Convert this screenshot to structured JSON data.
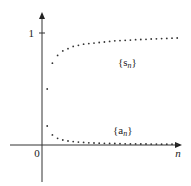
{
  "chart_data": {
    "type": "scatter",
    "title": "",
    "xlabel": "n",
    "ylabel": "",
    "origin_label": "0",
    "yticks": [
      {
        "value": 1,
        "label": "1"
      }
    ],
    "xlim": [
      0,
      28
    ],
    "ylim": [
      -0.3,
      1.2
    ],
    "grid": false,
    "legend": "inline labels",
    "series": [
      {
        "name": "{s_n}",
        "label_main": "{s",
        "label_sub": "n",
        "label_close": "}",
        "x": [
          1,
          2,
          3,
          4,
          5,
          6,
          7,
          8,
          9,
          10,
          11,
          12,
          13,
          14,
          15,
          16,
          17,
          18,
          19,
          20,
          21,
          22,
          23,
          24,
          25,
          26
        ],
        "values": [
          0.5,
          0.73,
          0.8,
          0.84,
          0.86,
          0.88,
          0.89,
          0.9,
          0.905,
          0.91,
          0.915,
          0.92,
          0.925,
          0.93,
          0.932,
          0.935,
          0.937,
          0.94,
          0.942,
          0.944,
          0.946,
          0.948,
          0.95,
          0.952,
          0.954,
          0.955
        ]
      },
      {
        "name": "{a_n}",
        "label_main": "{a",
        "label_sub": "n",
        "label_close": "}",
        "x": [
          1,
          2,
          3,
          4,
          5,
          6,
          7,
          8,
          9,
          10,
          11,
          12,
          13,
          14,
          15,
          16,
          17,
          18,
          19,
          20,
          21,
          22,
          23,
          24,
          25,
          26
        ],
        "values": [
          0.17,
          0.09,
          0.06,
          0.045,
          0.036,
          0.03,
          0.026,
          0.023,
          0.02,
          0.018,
          0.016,
          0.015,
          0.014,
          0.013,
          0.012,
          0.011,
          0.01,
          0.01,
          0.009,
          0.009,
          0.008,
          0.008,
          0.007,
          0.007,
          0.007,
          0.006
        ]
      }
    ]
  }
}
